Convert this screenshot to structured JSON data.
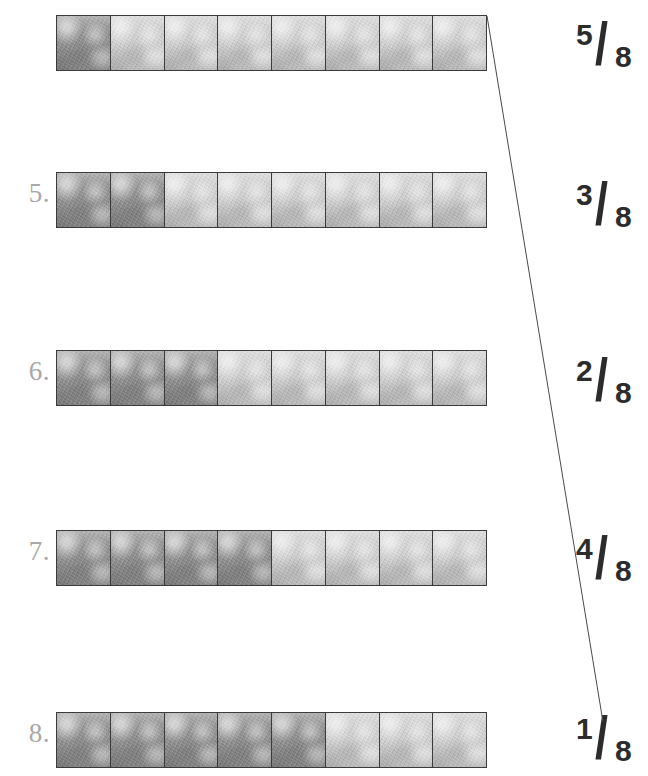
{
  "worksheet": {
    "total_parts": 8,
    "denominator_label": "8",
    "rows": [
      {
        "number_label": "",
        "has_number": false,
        "shaded_count": 1,
        "total_cells": 8,
        "top": 15
      },
      {
        "number_label": "5.",
        "has_number": true,
        "shaded_count": 2,
        "total_cells": 8,
        "top": 172
      },
      {
        "number_label": "6.",
        "has_number": true,
        "shaded_count": 3,
        "total_cells": 8,
        "top": 350
      },
      {
        "number_label": "7.",
        "has_number": true,
        "shaded_count": 4,
        "total_cells": 8,
        "top": 530
      },
      {
        "number_label": "8.",
        "has_number": true,
        "shaded_count": 5,
        "total_cells": 8,
        "top": 712
      }
    ],
    "fractions": [
      {
        "numerator": "5",
        "slash": "/",
        "denominator": "8",
        "top": 16
      },
      {
        "numerator": "3",
        "slash": "/",
        "denominator": "8",
        "top": 176
      },
      {
        "numerator": "2",
        "slash": "/",
        "denominator": "8",
        "top": 352
      },
      {
        "numerator": "4",
        "slash": "/",
        "denominator": "8",
        "top": 530
      },
      {
        "numerator": "1",
        "slash": "/",
        "denominator": "8",
        "top": 710
      }
    ],
    "connections": [
      {
        "from_row": 0,
        "to_fraction": 4,
        "x1": 487,
        "y1": 16,
        "x2": 603,
        "y2": 722
      }
    ],
    "colors": {
      "shaded_cell": "#8d8d8d",
      "unshaded_cell": "#d0d0d0",
      "cell_border": "#3b3b3b",
      "row_number": "#a8a8a8",
      "fraction_text": "#2c2c2c",
      "connector_line": "#4a4a4a",
      "page_background": "#ffffff"
    }
  }
}
